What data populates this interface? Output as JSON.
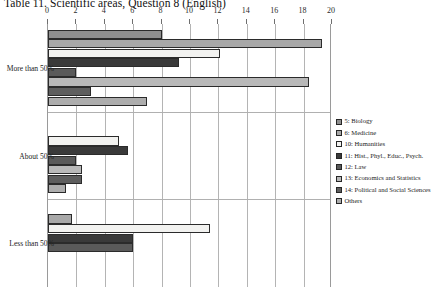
{
  "title": "Table 11.  Scientific areas, Question 8 (English)",
  "chart_data": {
    "type": "bar",
    "orientation": "horizontal",
    "title": "Table 11.  Scientific areas, Question 8 (English)",
    "xlabel": "",
    "ylabel": "",
    "xlim": [
      0,
      20
    ],
    "grid": true,
    "legend_position": "right",
    "categories": [
      "More than 50%",
      "About 50%",
      "Less than 50%"
    ],
    "tick_labels": [
      "0",
      "2",
      "4",
      "6",
      "8",
      "10",
      "12",
      "14",
      "16",
      "18",
      "20"
    ],
    "tick_values": [
      0,
      2,
      4,
      6,
      8,
      10,
      12,
      14,
      16,
      18,
      20
    ],
    "series": [
      {
        "name": "5: Biology",
        "values": [
          8.0,
          0.0,
          0.0
        ]
      },
      {
        "name": "6: Medicine",
        "values": [
          19.3,
          0.0,
          1.7
        ]
      },
      {
        "name": "10: Humanities",
        "values": [
          12.1,
          5.0,
          11.4
        ]
      },
      {
        "name": "11: Hist., Phyl., Educ., Psych.",
        "values": [
          9.2,
          5.6,
          6.0
        ]
      },
      {
        "name": "12: Law",
        "values": [
          2.0,
          2.0,
          6.0
        ]
      },
      {
        "name": "13: Economics and Statistics",
        "values": [
          18.4,
          2.4,
          0.0
        ]
      },
      {
        "name": "14: Political and Social Sciences",
        "values": [
          3.0,
          2.4,
          0.0
        ]
      },
      {
        "name": "Others",
        "values": [
          7.0,
          1.3,
          0.0
        ]
      }
    ]
  },
  "legend": {
    "items": [
      {
        "label": "5: Biology",
        "swatch": "biology-swatch"
      },
      {
        "label": "6: Medicine",
        "swatch": "medicine-swatch"
      },
      {
        "label": "10: Humanities",
        "swatch": "humanities-swatch"
      },
      {
        "label": "11: Hist., Phyl., Educ., Psych.",
        "swatch": "hist-swatch"
      },
      {
        "label": "12: Law",
        "swatch": "law-swatch"
      },
      {
        "label": "13: Economics and Statistics",
        "swatch": "econ-swatch"
      },
      {
        "label": "14: Political and Social Sciences",
        "swatch": "polit-swatch"
      },
      {
        "label": "Others",
        "swatch": "others-swatch"
      }
    ]
  },
  "colors": {
    "biology": "#8f8f8f",
    "medicine": "#a8a8a8",
    "humanities": "#f2f2f0",
    "hist": "#3a3a3a",
    "law": "#5a5a5a",
    "econ": "#b9b9b9",
    "polit": "#5e5e5e",
    "others": "#adadad",
    "grid": "#b4b4b4",
    "axis": "#6f6f6f"
  }
}
